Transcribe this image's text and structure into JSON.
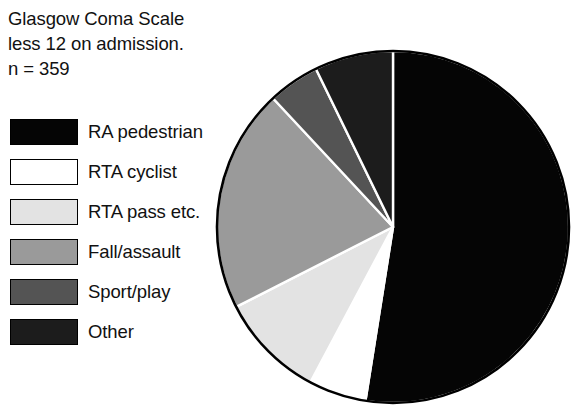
{
  "title": {
    "line1": "Glasgow Coma Scale",
    "line2": "less 12 on admission.",
    "line3": "n = 359"
  },
  "legend": {
    "items": [
      {
        "label": "RA pedestrian",
        "color": "#050505"
      },
      {
        "label": "RTA cyclist",
        "color": "#ffffff"
      },
      {
        "label": "RTA pass etc.",
        "color": "#e3e3e3"
      },
      {
        "label": "Fall/assault",
        "color": "#9a9a9a"
      },
      {
        "label": "Sport/play",
        "color": "#545454"
      },
      {
        "label": "Other",
        "color": "#1c1c1c"
      }
    ]
  },
  "chart_data": {
    "type": "pie",
    "title": "Glasgow Coma Scale less 12 on admission.",
    "subtitle": "n = 359",
    "total": 359,
    "start_angle_deg": 0,
    "direction": "clockwise",
    "separator_color": "#ffffff",
    "outline_color": "#000000",
    "labels": [
      "RA pedestrian",
      "RTA cyclist",
      "RTA pass etc.",
      "Fall/assault",
      "Sport/play",
      "Other"
    ],
    "values": [
      52.5,
      5.3,
      9.7,
      20.6,
      4.7,
      7.2
    ],
    "angles_deg": [
      189.0,
      19.0,
      35.0,
      74.0,
      17.0,
      26.0
    ],
    "colors": [
      "#050505",
      "#ffffff",
      "#e3e3e3",
      "#9a9a9a",
      "#545454",
      "#1c1c1c"
    ],
    "legend_position": "left",
    "grid": false
  },
  "geometry": {
    "center_x": 179,
    "center_y": 179,
    "radius": 176
  }
}
